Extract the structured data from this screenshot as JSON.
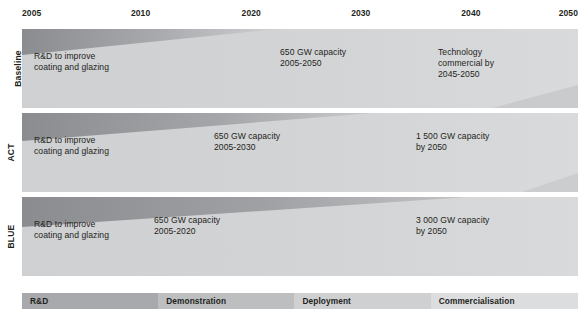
{
  "figure": {
    "type": "technology-roadmap-timeline",
    "width": 578,
    "height": 316
  },
  "axis": {
    "label": "Year",
    "ticks": [
      {
        "label": "2005",
        "x": 0
      },
      {
        "label": "2010",
        "x": 0.196
      },
      {
        "label": "2020",
        "x": 0.395
      },
      {
        "label": "2030",
        "x": 0.592
      },
      {
        "label": "2040",
        "x": 0.79
      },
      {
        "label": "2050",
        "x": 1.0
      }
    ],
    "range": [
      2005,
      2050
    ]
  },
  "rows": [
    {
      "label": "Baseline",
      "band_end": 0.46,
      "notes": [
        {
          "text": "R&D to improve\ncoating and glazing",
          "x": 12,
          "y": 22
        },
        {
          "text": "650 GW capacity\n2005-2050",
          "x": 258,
          "y": 18
        },
        {
          "text": "Technology\ncommercial by\n2045-2050",
          "x": 416,
          "y": 18
        }
      ]
    },
    {
      "label": "ACT",
      "band_end": 0.63,
      "notes": [
        {
          "text": "R&D to improve\ncoating and glazing",
          "x": 12,
          "y": 22
        },
        {
          "text": "650 GW capacity\n2005-2030",
          "x": 192,
          "y": 18
        },
        {
          "text": "1 500 GW capacity\nby 2050",
          "x": 394,
          "y": 18
        }
      ]
    },
    {
      "label": "BLUE",
      "band_end": 0.8,
      "notes": [
        {
          "text": "R&D to improve\ncoating and glazing",
          "x": 12,
          "y": 22
        },
        {
          "text": "650 GW capacity\n2005-2020",
          "x": 132,
          "y": 18
        },
        {
          "text": "3 000 GW capacity\nby 2050",
          "x": 394,
          "y": 18
        }
      ]
    }
  ],
  "legend": {
    "segments": [
      {
        "label": "R&D",
        "width": 0.245,
        "color": "#a7a9ac"
      },
      {
        "label": "Demonstration",
        "width": 0.245,
        "color": "#bcbec0"
      },
      {
        "label": "Deployment",
        "width": 0.245,
        "color": "#cfd0d2"
      },
      {
        "label": "Commercialisation",
        "width": 0.265,
        "color": "#dcdddf"
      }
    ]
  },
  "colors": {
    "band_dark": "#8d8f92",
    "band_mid": "#b4b6b8",
    "band_light": "#d2d3d5",
    "background": "#ffffff",
    "text": "#231f20"
  }
}
